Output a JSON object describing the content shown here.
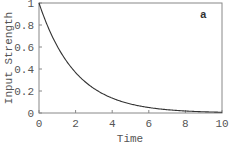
{
  "chart_data": {
    "type": "line",
    "title": "",
    "panel_label": "a",
    "xlabel": "Time",
    "ylabel": "Input Strength",
    "xlim": [
      0,
      10
    ],
    "ylim": [
      0,
      1
    ],
    "x_ticks": [
      "0",
      "2",
      "4",
      "6",
      "8",
      "10"
    ],
    "y_ticks": [
      "0",
      "0.2",
      "0.4",
      "0.6",
      "0.8",
      "1"
    ],
    "grid": false,
    "legend": null,
    "series": [
      {
        "name": "Input Strength",
        "function": "exp(-t/2)",
        "x": [
          0,
          1,
          2,
          3,
          4,
          5,
          6,
          7,
          8,
          9,
          10
        ],
        "values": [
          1.0,
          0.61,
          0.37,
          0.22,
          0.14,
          0.08,
          0.05,
          0.03,
          0.02,
          0.01,
          0.007
        ]
      }
    ]
  },
  "colors": {
    "curve": "#333333",
    "frame": "#777777",
    "text": "#555555"
  }
}
